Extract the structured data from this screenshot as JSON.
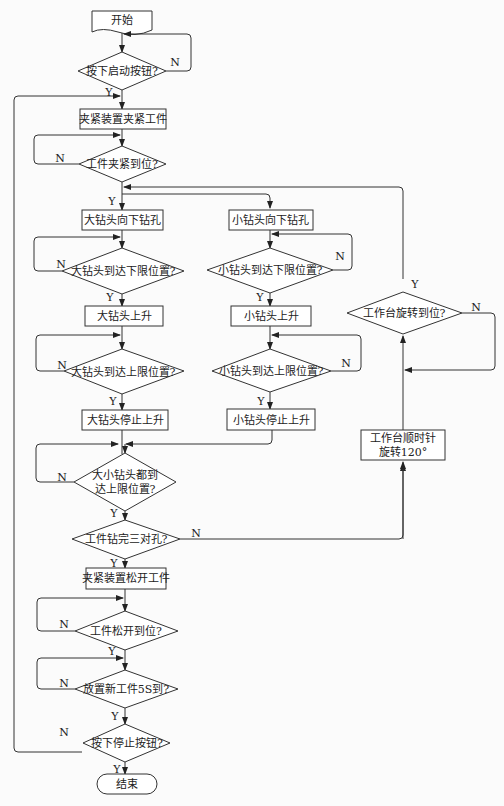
{
  "diagram": {
    "type": "flowchart",
    "nodes": {
      "start": "开始",
      "start_pressed": "按下启动按钮?",
      "clamp": "夹紧装置夹紧工件",
      "clamped": "工件夹紧到位?",
      "big_down": "大钻头向下钻孔",
      "small_down": "小钻头向下钻孔",
      "big_low": "大钻头到达下限位置?",
      "small_low": "小钻头到达下限位置?",
      "big_up": "大钻头上升",
      "small_up": "小钻头上升",
      "big_high": "大钻头到达上限位置?",
      "small_high": "小钻头到达上限位置?",
      "big_stop": "大钻头停止上升",
      "small_stop": "小钻头停止上升",
      "both_high_1": "大小钻头都到",
      "both_high_2": "达上限位置?",
      "three_pairs": "工件钻完三对孔?",
      "release": "夹紧装置松开工件",
      "released": "工件松开到位?",
      "new_part": "放置新工件5S到?",
      "stop_pressed": "按下停止按钮?",
      "end": "结束",
      "table_rotated": "工作台旋转到位?",
      "rotate_1": "工作台顺时针",
      "rotate_2": "旋转120°"
    },
    "labels": {
      "yes": "Y",
      "no": "N"
    }
  }
}
